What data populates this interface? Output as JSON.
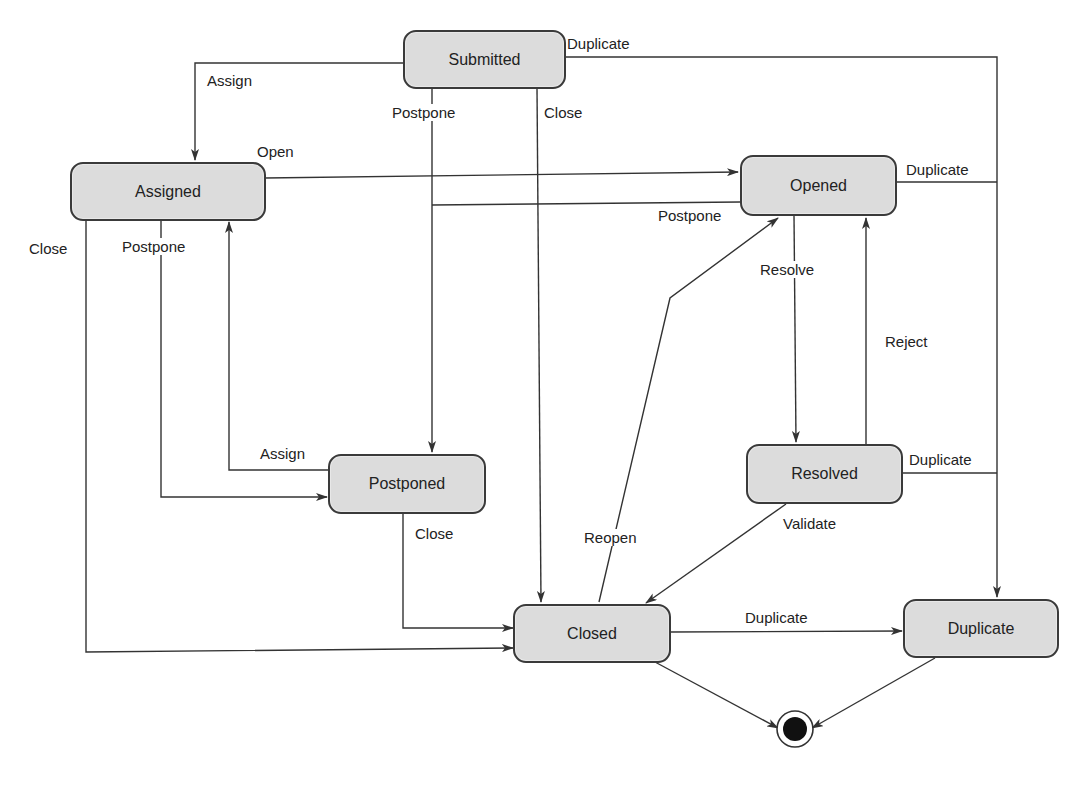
{
  "diagram": {
    "type": "state-machine",
    "states": {
      "submitted": "Submitted",
      "assigned": "Assigned",
      "opened": "Opened",
      "postponed": "Postponed",
      "resolved": "Resolved",
      "closed": "Closed",
      "duplicate": "Duplicate"
    },
    "final_state": "final-state-icon",
    "transitions": [
      {
        "from": "Submitted",
        "to": "Assigned",
        "label": "Assign"
      },
      {
        "from": "Submitted",
        "to": "Postponed",
        "label": "Postpone"
      },
      {
        "from": "Submitted",
        "to": "Closed",
        "label": "Close"
      },
      {
        "from": "Submitted",
        "to": "Duplicate",
        "label": "Duplicate"
      },
      {
        "from": "Assigned",
        "to": "Opened",
        "label": "Open"
      },
      {
        "from": "Assigned",
        "to": "Postponed",
        "label": "Postpone"
      },
      {
        "from": "Assigned",
        "to": "Closed",
        "label": "Close"
      },
      {
        "from": "Opened",
        "to": "Postponed",
        "label": "Postpone"
      },
      {
        "from": "Opened",
        "to": "Resolved",
        "label": "Resolve"
      },
      {
        "from": "Opened",
        "to": "Duplicate",
        "label": "Duplicate"
      },
      {
        "from": "Postponed",
        "to": "Assigned",
        "label": "Assign"
      },
      {
        "from": "Postponed",
        "to": "Closed",
        "label": "Close"
      },
      {
        "from": "Resolved",
        "to": "Opened",
        "label": "Reject"
      },
      {
        "from": "Resolved",
        "to": "Closed",
        "label": "Validate"
      },
      {
        "from": "Resolved",
        "to": "Duplicate",
        "label": "Duplicate"
      },
      {
        "from": "Closed",
        "to": "Opened",
        "label": "Reopen"
      },
      {
        "from": "Closed",
        "to": "Duplicate",
        "label": "Duplicate"
      },
      {
        "from": "Closed",
        "to": "Final",
        "label": ""
      },
      {
        "from": "Duplicate",
        "to": "Final",
        "label": ""
      }
    ],
    "edge_labels": {
      "submitted_assign": "Assign",
      "submitted_postpone": "Postpone",
      "submitted_close": "Close",
      "submitted_duplicate": "Duplicate",
      "assigned_open": "Open",
      "assigned_close": "Close",
      "assigned_postpone": "Postpone",
      "opened_postpone": "Postpone",
      "opened_duplicate": "Duplicate",
      "opened_resolve": "Resolve",
      "resolved_reject": "Reject",
      "resolved_duplicate": "Duplicate",
      "resolved_validate": "Validate",
      "postponed_assign": "Assign",
      "postponed_close": "Close",
      "closed_reopen": "Reopen",
      "closed_duplicate": "Duplicate"
    }
  }
}
